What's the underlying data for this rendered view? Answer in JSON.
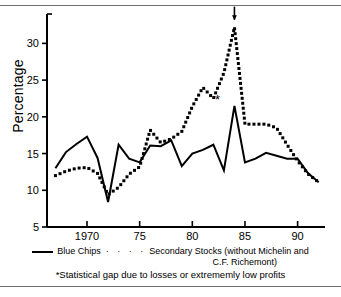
{
  "figure": {
    "ylabel": "Percentage",
    "arrow_annotation": "up-arrow",
    "asterisk_annotation": "*"
  },
  "legend": {
    "series1_label": "Blue Chips",
    "dots_glyph": "· · · ·",
    "series2_label": "Secondary Stocks (without Michelin and",
    "series2_label_cont": "C.F. Richemont)",
    "footnote": "*Statistical gap due to losses or extrememly low profits"
  },
  "chart_data": {
    "type": "line",
    "title": "",
    "xlabel": "",
    "ylabel": "Percentage",
    "xlim": [
      1966.2,
      1992.6
    ],
    "ylim": [
      5,
      34
    ],
    "grid": false,
    "legend_position": "below-axes",
    "xticks": [
      1970,
      1975,
      1980,
      1985,
      1990
    ],
    "xticklabels": [
      "1970",
      "75",
      "80",
      "85",
      "90"
    ],
    "yticks": [
      5,
      10,
      15,
      20,
      25,
      30
    ],
    "yticklabels": [
      "5",
      "10",
      "15",
      "20",
      "25",
      "30"
    ],
    "x": [
      1967,
      1968,
      1969,
      1970,
      1971,
      1972,
      1973,
      1974,
      1975,
      1976,
      1977,
      1978,
      1979,
      1980,
      1981,
      1982,
      1983,
      1984,
      1985,
      1986,
      1987,
      1988,
      1989,
      1990,
      1991,
      1992
    ],
    "series": [
      {
        "name": "Blue Chips",
        "style": "solid",
        "values": [
          13.0,
          15.2,
          16.3,
          17.3,
          14.4,
          8.4,
          16.2,
          14.3,
          13.8,
          16.1,
          16.0,
          16.8,
          13.3,
          15.0,
          15.5,
          16.2,
          12.7,
          21.5,
          13.8,
          14.3,
          15.1,
          14.7,
          14.3,
          14.3,
          12.3,
          11.1
        ]
      },
      {
        "name": "Secondary Stocks (without Michelin and C.F. Richemont)",
        "style": "dotted",
        "values": [
          12.0,
          12.6,
          13.0,
          13.1,
          12.3,
          9.4,
          10.4,
          12.2,
          13.2,
          18.2,
          16.5,
          17.0,
          18.0,
          21.4,
          24.0,
          22.5,
          26.0,
          32.2,
          19.0,
          19.0,
          19.0,
          18.5,
          16.2,
          14.0,
          12.2,
          11.1
        ]
      }
    ],
    "annotations": [
      {
        "type": "arrow",
        "x": 1984,
        "y": 33.5,
        "note": "arrow above secondary stocks peak"
      },
      {
        "type": "asterisk",
        "x": 1982.4,
        "y": 22.3,
        "label": "*"
      }
    ]
  }
}
